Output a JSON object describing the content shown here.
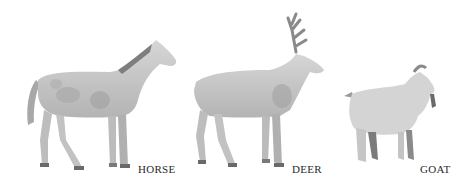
{
  "illustration": {
    "description": "Pencil-shaded illustration of three hoofed animals standing in profile facing right",
    "animals": [
      {
        "name": "horse",
        "label": "HORSE"
      },
      {
        "name": "deer",
        "label": "DEER"
      },
      {
        "name": "goat",
        "label": "GOAT"
      }
    ],
    "colors": {
      "background": "#ffffff",
      "body_fill": "#c9c9c9",
      "shade": "#9c9c9c",
      "dark": "#6a6a6a",
      "label_text": "#2a2a2a"
    }
  }
}
